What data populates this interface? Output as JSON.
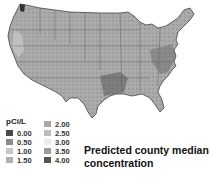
{
  "map": {
    "region": "Contiguous United States",
    "style": "grayscale county choropleth with state borders"
  },
  "legend": {
    "title": "pCi/L",
    "items": [
      {
        "label": "0.00",
        "color": "#4a4a4a"
      },
      {
        "label": "0.50",
        "color": "#8a8a8a"
      },
      {
        "label": "1.00",
        "color": "#c8c8c8"
      },
      {
        "label": "1.50",
        "color": "#b0b0b0"
      },
      {
        "label": "2.00",
        "color": "#a8a8a8"
      },
      {
        "label": "2.50",
        "color": "#bdbdbd"
      },
      {
        "label": "3.00",
        "color": "#ececec"
      },
      {
        "label": "3.50",
        "color": "#9c9c9c"
      },
      {
        "label": "4.00",
        "color": "#555555"
      }
    ]
  },
  "caption": {
    "line1": "Predicted county median",
    "line2": "concentration"
  }
}
